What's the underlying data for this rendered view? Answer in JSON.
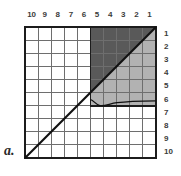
{
  "figure": {
    "panel_letter": "a.",
    "colors": {
      "background": "#ffffff",
      "grid_line": "#6e6e6e",
      "border": "#1c1c1c",
      "diagonal_line": "#111111",
      "dark_fill": "#595959",
      "light_fill": "#b2b2b2",
      "label_text": "#3b3b3b"
    },
    "grid": {
      "columns": 10,
      "rows": 10,
      "x0": 25,
      "y0": 27,
      "cell": 13.1,
      "width": 131,
      "height": 131
    },
    "column_labels": [
      "10",
      "9",
      "8",
      "7",
      "6",
      "5",
      "4",
      "3",
      "2",
      "1"
    ],
    "row_labels": [
      "1",
      "2",
      "3",
      "4",
      "5",
      "6",
      "7",
      "8",
      "9",
      "10"
    ],
    "diagonal": {
      "from": [
        0,
        10
      ],
      "to": [
        10,
        0
      ],
      "description": "diagonal from bottom-left corner to top-right corner"
    },
    "shaded_box": {
      "col_start": 5,
      "col_end": 10,
      "row_start": 0,
      "row_end": 6,
      "size_cells": 6,
      "dark_region": "above-diagonal",
      "light_region": "below-diagonal"
    },
    "curve": {
      "description": "wavy boundary along the bottom edge of the shaded box",
      "points": [
        [
          75,
          99
        ],
        [
          82,
          100
        ],
        [
          88,
          103
        ],
        [
          95,
          104
        ],
        [
          103,
          103
        ],
        [
          112,
          101
        ],
        [
          124,
          100
        ],
        [
          140,
          99
        ],
        [
          156,
          99
        ]
      ]
    }
  }
}
